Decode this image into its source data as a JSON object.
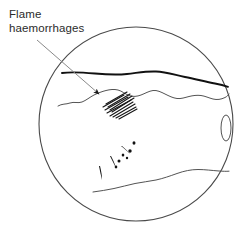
{
  "figure": {
    "name": "fundus-flame-haemorrhages-diagram",
    "background_color": "#ffffff",
    "width": 244,
    "height": 238
  },
  "annotation": {
    "label_line_1": "Flame",
    "label_line_2": "haemorrhages",
    "text_color": "#2b2b2b",
    "leader_line": {
      "from_x": 37,
      "from_y": 40,
      "to_x": 101,
      "to_y": 96,
      "color": "#8a8a8a",
      "arrowhead_color": "#1a1a1a"
    }
  },
  "fundus": {
    "outline": {
      "center_x": 136,
      "center_y": 124,
      "radius": 97,
      "stroke_color": "#4a4a4a",
      "stroke_width": 1.1,
      "fill": "#ffffff"
    },
    "optic_disc": {
      "center_x": 226,
      "center_y": 128,
      "radius_x": 5,
      "radius_y": 13,
      "stroke_color": "#4a4a4a"
    },
    "vessel_upper_thick": {
      "stroke_color": "#111111",
      "stroke_width": 1.9
    },
    "vessel_upper_thin": {
      "stroke_color": "#4a4a4a",
      "stroke_width": 0.9
    },
    "vessel_lower": {
      "stroke_color": "#4a4a4a",
      "stroke_width": 0.9
    },
    "flame_haemorrhage_patch": {
      "stroke_color": "#161616",
      "stroke_count": 11,
      "description": "parallel diagonal flame-shaped streak haemorrhages"
    },
    "dot_blot_haemorrhages": {
      "fill_color": "#121212",
      "count": 9,
      "description": "small dark dot and blot haemorrhages in lower field"
    }
  }
}
